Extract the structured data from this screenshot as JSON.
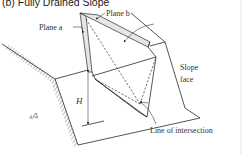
{
  "figure": {
    "title": "(b) Fully Drained Slope",
    "labels": {
      "plane_a": "Plane a",
      "plane_b": "Plane b",
      "slope_face_line1": "Slope",
      "slope_face_line2": "face",
      "height": "H",
      "line_of_intersection": "Line of intersection"
    },
    "colors": {
      "line": "#2a2a2a",
      "plane_fill": "#e6e6e6",
      "background": "#ffffff"
    }
  }
}
